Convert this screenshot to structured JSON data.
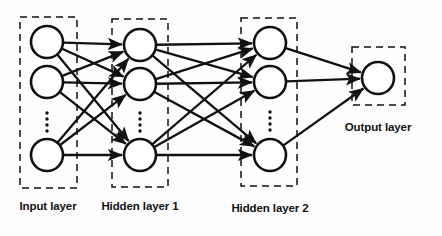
{
  "diagram": {
    "style": {
      "stroke_color": "#111111",
      "node_fill": "#ffffff",
      "background": "#ffffff",
      "box_dash": "7 5"
    },
    "layers": [
      {
        "id": "input",
        "label": "Input layer",
        "label_x": 48,
        "label_y": 210,
        "box": {
          "x": 20,
          "y": 17,
          "width": 57,
          "height": 171
        },
        "node_x": 47,
        "node_radius": 16,
        "nodes": [
          {
            "cy": 42
          },
          {
            "cy": 82
          },
          {
            "cy": 155
          }
        ],
        "ellipsis": {
          "x": 47,
          "y_start": 113,
          "y_end": 131,
          "count": 4
        }
      },
      {
        "id": "hidden1",
        "label": "Hidden layer 1",
        "label_x": 140,
        "label_y": 210,
        "box": {
          "x": 112,
          "y": 19,
          "width": 56,
          "height": 168
        },
        "node_x": 140,
        "node_radius": 16,
        "nodes": [
          {
            "cy": 45
          },
          {
            "cy": 84
          },
          {
            "cy": 155
          }
        ],
        "ellipsis": {
          "x": 140,
          "y_start": 113,
          "y_end": 131,
          "count": 4
        }
      },
      {
        "id": "hidden2",
        "label": "Hidden layer 2",
        "label_x": 270,
        "label_y": 212,
        "box": {
          "x": 241,
          "y": 18,
          "width": 56,
          "height": 168
        },
        "node_x": 270,
        "node_radius": 16,
        "nodes": [
          {
            "cy": 43
          },
          {
            "cy": 82
          },
          {
            "cy": 155
          }
        ],
        "ellipsis": {
          "x": 270,
          "y_start": 112,
          "y_end": 130,
          "count": 4
        }
      },
      {
        "id": "output",
        "label": "Output layer",
        "label_x": 378,
        "label_y": 131,
        "box": {
          "x": 352,
          "y": 47,
          "width": 53,
          "height": 58
        },
        "node_x": 378,
        "node_radius": 16,
        "nodes": [
          {
            "cy": 78
          }
        ],
        "ellipsis": null
      }
    ],
    "connections": [
      {
        "from_layer": "input",
        "to_layer": "hidden1",
        "fully_connected": true,
        "count": 9,
        "arrowheads": true
      },
      {
        "from_layer": "hidden1",
        "to_layer": "hidden2",
        "fully_connected": true,
        "count": 9,
        "arrowheads": true
      },
      {
        "from_layer": "hidden2",
        "to_layer": "output",
        "fully_connected": true,
        "count": 3,
        "arrowheads": true
      }
    ]
  }
}
